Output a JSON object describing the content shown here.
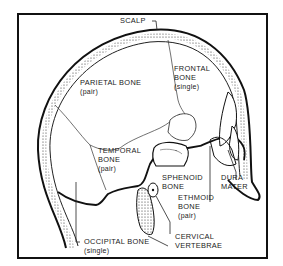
{
  "diagram": {
    "labels": {
      "scalp": "SCALP",
      "parietal": {
        "name": "PARIETAL BONE",
        "note": "(pair)"
      },
      "frontal": {
        "name_line1": "FRONTAL",
        "name_line2": "BONE",
        "note": "(single)"
      },
      "temporal": {
        "name_line1": "TEMPORAL",
        "name_line2": "BONE",
        "note": "(pair)"
      },
      "sphenoid": {
        "name_line1": "SPHENOID",
        "name_line2": "BONE"
      },
      "dura": {
        "name_line1": "DURA",
        "name_line2": "MATER"
      },
      "ethmoid": {
        "name_line1": "ETHMOID",
        "name_line2": "BONE",
        "note": "(pair)"
      },
      "cervical": {
        "name_line1": "CERVICAL",
        "name_line2": "VERTEBRAE"
      },
      "occipital": {
        "name": "OCCIPITAL BONE",
        "note": "(single)"
      }
    },
    "colors": {
      "ink": "#1a1a1a",
      "background": "#ffffff"
    }
  }
}
